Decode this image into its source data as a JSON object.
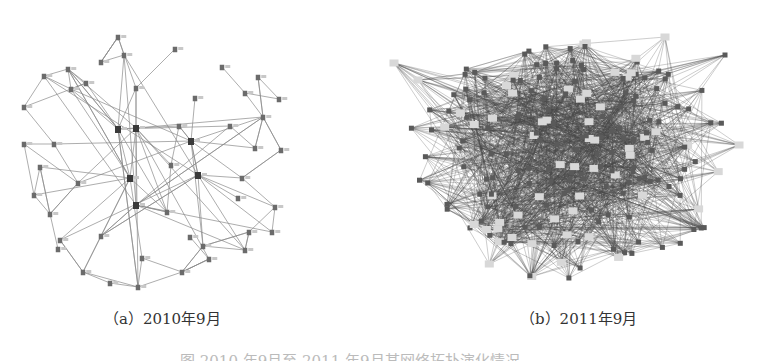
{
  "figure": {
    "panels": [
      {
        "id": "a",
        "caption": "（a）2010年9月",
        "graph": {
          "node_color": "#6b6b6b",
          "edge_color": "#8a8a8a",
          "nodes": [
            [
              118,
              37
            ],
            [
              124,
              55
            ],
            [
              101,
              62
            ],
            [
              68,
              69
            ],
            [
              175,
              49
            ],
            [
              222,
              67
            ],
            [
              258,
              77
            ],
            [
              44,
              76
            ],
            [
              136,
              88
            ],
            [
              86,
              83
            ],
            [
              71,
              89
            ],
            [
              24,
              107
            ],
            [
              195,
              98
            ],
            [
              245,
              93
            ],
            [
              279,
              99
            ],
            [
              263,
              117
            ],
            [
              118,
              129
            ],
            [
              136,
              128
            ],
            [
              179,
              126
            ],
            [
              230,
              126
            ],
            [
              191,
              141
            ],
            [
              54,
              144
            ],
            [
              24,
              144
            ],
            [
              255,
              148
            ],
            [
              281,
              150
            ],
            [
              40,
              167
            ],
            [
              171,
              165
            ],
            [
              130,
              178
            ],
            [
              198,
              175
            ],
            [
              242,
              178
            ],
            [
              78,
              183
            ],
            [
              34,
              195
            ],
            [
              238,
              198
            ],
            [
              136,
              205
            ],
            [
              167,
              212
            ],
            [
              50,
              214
            ],
            [
              275,
              207
            ],
            [
              101,
              236
            ],
            [
              190,
              237
            ],
            [
              249,
              232
            ],
            [
              272,
              232
            ],
            [
              60,
              240
            ],
            [
              203,
              246
            ],
            [
              58,
              249
            ],
            [
              245,
              250
            ],
            [
              142,
              258
            ],
            [
              209,
              259
            ],
            [
              83,
              272
            ],
            [
              182,
              272
            ],
            [
              110,
              283
            ],
            [
              138,
              287
            ]
          ],
          "hubs": [
            [
              136,
              128
            ],
            [
              118,
              129
            ],
            [
              130,
              178
            ],
            [
              198,
              175
            ],
            [
              136,
              205
            ],
            [
              191,
              141
            ]
          ],
          "edge_count_estimate": 120
        }
      },
      {
        "id": "b",
        "caption": "（b）2011年9月",
        "graph": {
          "node_color": "#5a5a5a",
          "edge_color": "#4a4a4a",
          "highlight_node_color": "#d8d8d8",
          "density": "very dense",
          "cloud_bounds": {
            "cx": 570,
            "cy": 160,
            "rx": 165,
            "ry": 120
          },
          "node_count_estimate": 200,
          "edge_count_estimate": 1600
        }
      }
    ],
    "figure_caption": "图 2010 年9月至 2011 年9月某网络拓扑演化情况"
  }
}
